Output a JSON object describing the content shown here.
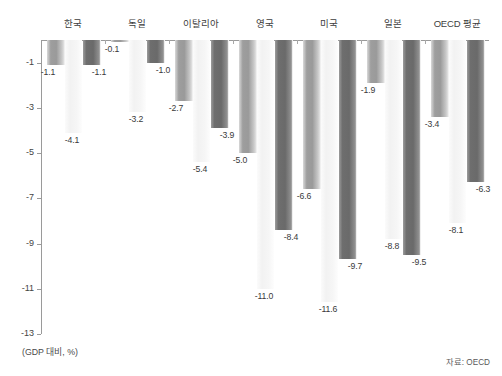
{
  "chart_data": {
    "type": "bar",
    "title": "",
    "subtitle": "",
    "xlabel": "",
    "ylabel": "",
    "unit_caption": "(GDP 대비, %)",
    "source_caption": "자료: OECD",
    "categories": [
      "한국",
      "독일",
      "이탈리아",
      "영국",
      "미국",
      "일본",
      "OECD 평균"
    ],
    "series": [
      {
        "name": "series-1",
        "color": "#9a9a9a",
        "values": [
          -1.1,
          -0.1,
          -2.7,
          -5.0,
          -6.6,
          -1.9,
          -3.4
        ],
        "labels": [
          "-1.1",
          "-0.1",
          "-2.7",
          "-5.0",
          "-6.6",
          "-1.9",
          "-3.4"
        ]
      },
      {
        "name": "series-2",
        "color": "#f5f5f5",
        "values": [
          -4.1,
          -3.2,
          -5.4,
          -11.0,
          -11.6,
          -8.8,
          -8.1
        ],
        "labels": [
          "-4.1",
          "-3.2",
          "-5.4",
          "-11.0",
          "-11.6",
          "-8.8",
          "-8.1"
        ]
      },
      {
        "name": "series-3",
        "color": "#6d6d6d",
        "values": [
          -1.1,
          -1.0,
          -3.9,
          -8.4,
          -9.7,
          -9.5,
          -6.3
        ],
        "labels": [
          "-1.1",
          "-1.0",
          "-3.9",
          "-8.4",
          "-9.7",
          "-9.5",
          "-6.3"
        ]
      }
    ],
    "ylim": [
      -13,
      0
    ],
    "yticks": [
      -1,
      -3,
      -5,
      -7,
      -9,
      -11,
      -13
    ],
    "ytick_labels": [
      "-1",
      "-3",
      "-5",
      "-7",
      "-9",
      "-11",
      "-13"
    ],
    "grid": false,
    "legend": "none",
    "orientation": "vertical-negative"
  }
}
